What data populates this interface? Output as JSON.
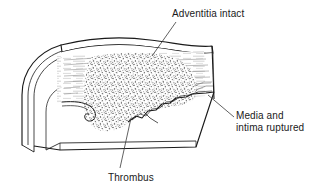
{
  "figure": {
    "background_color": "#ffffff",
    "ink_color": "#1a1a1a",
    "stipple_color": "#555555"
  },
  "labels": {
    "adventitia": {
      "text": "Adventitia intact",
      "icon": "text-label"
    },
    "media_intima": {
      "line1": "Media and",
      "line2": "intima ruptured",
      "icon": "text-label"
    },
    "thrombus": {
      "text": "Thrombus",
      "icon": "text-label"
    }
  },
  "leaders": [
    {
      "name": "leader-adventitia",
      "from": [
        176,
        22
      ],
      "to": [
        152,
        56
      ]
    },
    {
      "name": "leader-media-intima",
      "from": [
        234,
        116
      ],
      "to": [
        208,
        96
      ]
    },
    {
      "name": "leader-thrombus",
      "from": [
        120,
        168
      ],
      "to": [
        130,
        120
      ]
    }
  ],
  "structures": {
    "adventitia_band": "intact outer wavy band across the top of the vessel",
    "media_layer": "horizontally striated layer beneath the adventitia",
    "intima_flap": "curled torn flap at the lower left of the lumen",
    "rupture_zone": "jagged stepped tear along the lower right of the media and intima",
    "thrombus_mass": "dense stippled mass filling the lumen",
    "cut_end": "concentric curved lines at the left showing the cut vessel wall"
  }
}
